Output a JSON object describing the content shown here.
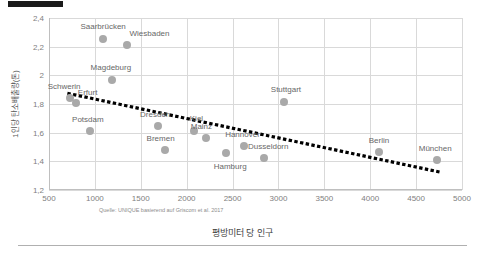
{
  "chart_data": {
    "type": "scatter",
    "title": "",
    "xlabel": "평방미터 당 인구",
    "ylabel": "1인당 탄소배출량(톤)",
    "xlim": [
      500,
      5000
    ],
    "ylim": [
      1.2,
      2.4
    ],
    "xticks": [
      "500",
      "1000",
      "1500",
      "2000",
      "2500",
      "3000",
      "3500",
      "4000",
      "4500",
      "5000"
    ],
    "xtick_values": [
      500,
      1000,
      1500,
      2000,
      2500,
      3000,
      3500,
      4000,
      4500,
      5000
    ],
    "yticks": [
      "1,2",
      "1,4",
      "1,6",
      "1,8",
      "2",
      "2,2",
      "2,4"
    ],
    "ytick_values": [
      1.2,
      1.4,
      1.6,
      1.8,
      2.0,
      2.2,
      2.4
    ],
    "grid": true,
    "legend": "none",
    "source_note": "Quelle: UNIQUE basierend auf Griscom et al. 2017",
    "point_color": "#a9a9a9",
    "trendline_color": "#000000",
    "trendline": {
      "style": "dotted",
      "x_start": 700,
      "y_start": 1.875,
      "x_end": 4760,
      "y_end": 1.325
    },
    "points": [
      {
        "label": "Saarbrücken",
        "x": 1090,
        "y": 2.255,
        "label_dx": 0,
        "label_dy": -13
      },
      {
        "label": "Wiesbaden",
        "x": 1355,
        "y": 2.215,
        "label_dx": 22,
        "label_dy": -12
      },
      {
        "label": "Magdeburg",
        "x": 1185,
        "y": 1.965,
        "label_dx": -1,
        "label_dy": -13
      },
      {
        "label": "Schwerin",
        "x": 730,
        "y": 1.84,
        "label_dx": -6,
        "label_dy": -12
      },
      {
        "label": "Erfurt",
        "x": 790,
        "y": 1.805,
        "label_dx": 12,
        "label_dy": -11
      },
      {
        "label": "Potsdam",
        "x": 945,
        "y": 1.615,
        "label_dx": -2,
        "label_dy": -12
      },
      {
        "label": "Dresden",
        "x": 1690,
        "y": 1.645,
        "label_dx": -3,
        "label_dy": -12
      },
      {
        "label": "Bremen",
        "x": 1760,
        "y": 1.48,
        "label_dx": -4,
        "label_dy": -12
      },
      {
        "label": "Kiel",
        "x": 2085,
        "y": 1.615,
        "label_dx": 2,
        "label_dy": -13
      },
      {
        "label": "Mainz",
        "x": 2215,
        "y": 1.565,
        "label_dx": -5,
        "label_dy": -12
      },
      {
        "label": "Hamburg",
        "x": 2430,
        "y": 1.455,
        "label_dx": 4,
        "label_dy": 13
      },
      {
        "label": "Hannover",
        "x": 2630,
        "y": 1.51,
        "label_dx": -2,
        "label_dy": -12
      },
      {
        "label": "Dusseldorn",
        "x": 2845,
        "y": 1.425,
        "label_dx": 4,
        "label_dy": -12
      },
      {
        "label": "Stuttgart",
        "x": 3060,
        "y": 1.815,
        "label_dx": 2,
        "label_dy": -13
      },
      {
        "label": "Berlin",
        "x": 4095,
        "y": 1.465,
        "label_dx": 0,
        "label_dy": -12
      },
      {
        "label": "München",
        "x": 4730,
        "y": 1.41,
        "label_dx": -2,
        "label_dy": -12
      }
    ]
  }
}
